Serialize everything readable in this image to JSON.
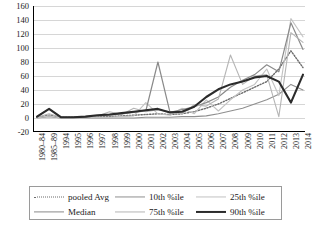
{
  "chart_data": {
    "type": "line",
    "title": "",
    "xlabel": "",
    "ylabel": "",
    "ylim": [
      -20,
      160
    ],
    "ytick_step": 20,
    "grid": true,
    "legend_position": "bottom",
    "yticks": [
      "-20",
      "0",
      "20",
      "40",
      "60",
      "80",
      "100",
      "120",
      "140",
      "160"
    ],
    "categories": [
      "1980–84",
      "1985–89",
      "1994",
      "1995",
      "1996",
      "1997",
      "1998",
      "1999",
      "2000",
      "2001",
      "2002",
      "2003",
      "2004",
      "2005",
      "2006",
      "2007",
      "2008",
      "2009",
      "2010",
      "2011",
      "2012",
      "2013",
      "2014"
    ],
    "series": [
      {
        "name": "pooled Avg",
        "style": "dotted",
        "color": "#6b6b6b",
        "width": 1.4,
        "values": [
          1,
          4,
          1,
          1,
          1,
          2,
          2,
          3,
          4,
          5,
          6,
          5,
          6,
          9,
          14,
          20,
          28,
          36,
          44,
          52,
          70,
          96,
          72
        ]
      },
      {
        "name": "10th %ile",
        "style": "solid",
        "color": "#8f8f8f",
        "width": 1.1,
        "values": [
          0,
          2,
          0,
          0,
          0,
          0,
          0,
          0,
          0,
          1,
          1,
          1,
          2,
          2,
          3,
          6,
          10,
          14,
          20,
          26,
          34,
          48,
          40
        ]
      },
      {
        "name": "25th %ile",
        "style": "solid",
        "color": "#c2c2c2",
        "width": 1.1,
        "values": [
          0,
          3,
          0,
          0,
          0,
          1,
          1,
          2,
          3,
          22,
          6,
          4,
          14,
          6,
          26,
          10,
          26,
          40,
          48,
          70,
          32,
          142,
          116
        ]
      },
      {
        "name": "Median",
        "style": "solid",
        "color": "#8a8a8a",
        "width": 1.2,
        "values": [
          2,
          13,
          1,
          1,
          2,
          3,
          4,
          6,
          8,
          10,
          80,
          8,
          12,
          16,
          22,
          30,
          44,
          54,
          62,
          76,
          66,
          136,
          98
        ]
      },
      {
        "name": "75th %ile",
        "style": "solid",
        "color": "#b5b5b5",
        "width": 1.1,
        "values": [
          1,
          6,
          1,
          1,
          2,
          3,
          9,
          5,
          14,
          9,
          12,
          9,
          6,
          19,
          17,
          27,
          90,
          48,
          60,
          62,
          2,
          122,
          108
        ]
      },
      {
        "name": "90th %ile",
        "style": "solid",
        "color": "#2b2b2b",
        "width": 2.1,
        "values": [
          2,
          13,
          1,
          1,
          2,
          4,
          5,
          7,
          9,
          11,
          13,
          8,
          9,
          16,
          30,
          41,
          48,
          52,
          58,
          60,
          52,
          22,
          62
        ]
      }
    ]
  },
  "legend": {
    "items": [
      {
        "label": "pooled Avg",
        "icon": "dotted-line-swatch"
      },
      {
        "label": "10th %ile",
        "icon": "solid-line-swatch"
      },
      {
        "label": "25th %ile",
        "icon": "light-line-swatch"
      },
      {
        "label": "Median",
        "icon": "solid-line-swatch"
      },
      {
        "label": "75th %ile",
        "icon": "light-line-swatch"
      },
      {
        "label": "90th %ile",
        "icon": "thick-line-swatch"
      }
    ]
  }
}
